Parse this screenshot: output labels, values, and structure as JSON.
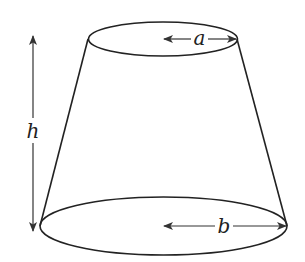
{
  "diagram": {
    "type": "frustum",
    "colors": {
      "stroke": "#222222",
      "arrow": "#333333",
      "background": "#ffffff"
    },
    "labels": {
      "height": "h",
      "top_radius": "a",
      "bottom_radius": "b"
    },
    "shapes": {
      "top_ellipse": {
        "cx": 163,
        "cy": 39,
        "rx": 74,
        "ry": 17
      },
      "bottom_ellipse": {
        "cx": 164,
        "cy": 226,
        "rx": 124,
        "ry": 29
      },
      "left_side": {
        "x1": 88,
        "y1": 39,
        "x2": 40,
        "y2": 226
      },
      "right_side": {
        "x1": 237,
        "y1": 39,
        "x2": 287,
        "y2": 226
      }
    }
  }
}
